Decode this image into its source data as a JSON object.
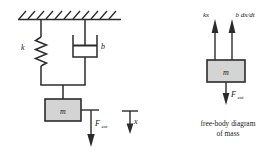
{
  "figure": {
    "background_color": "#ffffff",
    "line_color": "#2b2b2b",
    "mass_fill_color": "#d4d4d4"
  },
  "schematic": {
    "name": "mass-spring-damper-schematic",
    "ceiling": {
      "label": "fixed-support-hatching"
    },
    "spring": {
      "label": "k"
    },
    "damper": {
      "label": "b"
    },
    "mass": {
      "label": "m"
    },
    "applied_force": {
      "label": "F",
      "subscript": "ext"
    },
    "displacement": {
      "label": "x"
    }
  },
  "free_body": {
    "name": "free-body-diagram",
    "mass": {
      "label": "m"
    },
    "spring_force": {
      "label": "kx"
    },
    "damper_force": {
      "label": "b dx/dt"
    },
    "applied_force": {
      "label": "F",
      "subscript": "ext"
    },
    "caption_line1": "free-body diagram",
    "caption_line2": "of mass"
  }
}
